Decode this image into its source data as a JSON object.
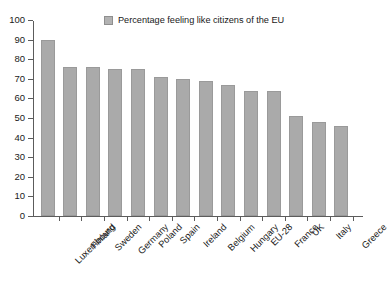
{
  "chart_data": {
    "type": "bar",
    "title": "",
    "subtitle": "",
    "xlabel": "",
    "ylabel": "",
    "ylim": [
      0,
      100
    ],
    "ytick_step": 10,
    "yticks": [
      100,
      90,
      80,
      70,
      60,
      50,
      40,
      30,
      20,
      10,
      0
    ],
    "grid": false,
    "legend_position": "top-center",
    "legend": [
      {
        "name": "Percentage feeling like citizens of the EU",
        "color": "#aaaaaa"
      }
    ],
    "categories": [
      "Luxembourg",
      "Finland",
      "Sweden",
      "Germany",
      "Poland",
      "Spain",
      "Ireland",
      "Belgium",
      "Hungary",
      "EU-28",
      "France",
      "UK",
      "Italy",
      "Greece"
    ],
    "values": [
      90,
      76,
      76,
      75,
      75,
      71,
      70,
      69,
      67,
      64,
      64,
      51,
      48,
      46
    ],
    "series": [
      {
        "name": "Percentage feeling like citizens of the EU",
        "color": "#aaaaaa",
        "values": [
          90,
          76,
          76,
          75,
          75,
          71,
          70,
          69,
          67,
          64,
          64,
          51,
          48,
          46
        ]
      }
    ]
  },
  "colors": {
    "bar_fill": "#aaaaaa",
    "bar_stroke": "#9a9a9a",
    "axis": "#5c5c5c",
    "text": "#1a1a1a",
    "background": "#ffffff"
  }
}
